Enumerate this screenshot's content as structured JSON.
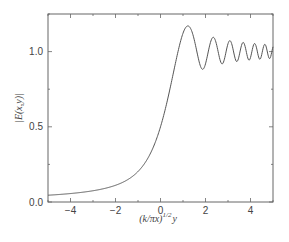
{
  "chart_data": {
    "type": "line",
    "title": "",
    "xlabel": "(k/πx)^{1/2} y",
    "xlabel_main": "(k/πx)",
    "xlabel_sup": "1/2",
    "xlabel_tail": "y",
    "ylabel": "|E(x,y)|",
    "xlim": [
      -5,
      5
    ],
    "ylim": [
      0,
      1.25
    ],
    "xticks": [
      -4,
      -2,
      0,
      2,
      4
    ],
    "xtick_labels": [
      "-4",
      "-2",
      "0",
      "2",
      "4"
    ],
    "yticks": [
      0.0,
      0.5,
      1.0
    ],
    "ytick_labels": [
      "0.0",
      "0.5",
      "1.0"
    ],
    "grid": false,
    "legend": null,
    "series": [
      {
        "name": "|E(x,y)|",
        "color": "#555555",
        "model": "fresnel-edge",
        "x": [
          -5,
          -4.5,
          -4,
          -3.5,
          -3,
          -2.5,
          -2,
          -1.5,
          -1,
          -0.75,
          -0.5,
          -0.25,
          0,
          0.25,
          0.5,
          0.75,
          1.0,
          1.22,
          1.5,
          1.87,
          2.34,
          2.74,
          3.08,
          3.39,
          3.67,
          3.94,
          4.18,
          4.42,
          4.64,
          4.85,
          5.0
        ],
        "y": [
          0.045,
          0.05,
          0.056,
          0.064,
          0.074,
          0.09,
          0.113,
          0.15,
          0.21,
          0.26,
          0.33,
          0.41,
          0.5,
          0.61,
          0.72,
          0.87,
          1.01,
          1.17,
          1.09,
          0.88,
          1.09,
          0.91,
          1.07,
          0.93,
          1.06,
          0.94,
          1.05,
          0.95,
          1.05,
          0.96,
          1.02
        ]
      }
    ]
  }
}
